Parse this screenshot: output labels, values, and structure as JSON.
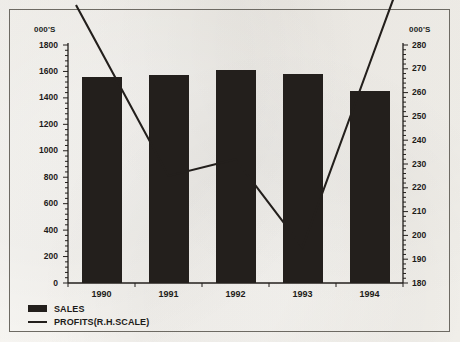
{
  "chart_data": {
    "type": "bar",
    "title": "",
    "categories": [
      "1990",
      "1991",
      "1992",
      "1993",
      "1994"
    ],
    "xlabel": "",
    "left_axis": {
      "label": "000'S",
      "ylim": [
        0,
        1800
      ],
      "tick_step": 200,
      "ticks": [
        "0",
        "200",
        "400",
        "600",
        "800",
        "1000",
        "1200",
        "1400",
        "1600",
        "1800"
      ]
    },
    "right_axis": {
      "label": "000'S",
      "ylim": [
        180,
        280
      ],
      "tick_step": 10,
      "ticks": [
        "180",
        "190",
        "200",
        "210",
        "220",
        "230",
        "240",
        "250",
        "260",
        "270",
        "280"
      ]
    },
    "grid": false,
    "legend_position": "bottom-left",
    "series": [
      {
        "name": "SALES",
        "type": "bar",
        "axis": "left",
        "color": "#231f1c",
        "values": [
          1560,
          1570,
          1610,
          1580,
          1455
        ]
      },
      {
        "name": "PROFITS(R.H.SCALE)",
        "type": "line",
        "axis": "right",
        "color": "#231f1c",
        "values": [
          277,
          225,
          232,
          195,
          272
        ]
      }
    ]
  },
  "legend": {
    "items": [
      {
        "label": "SALES",
        "marker": "filled-square"
      },
      {
        "label": "PROFITS(R.H.SCALE)",
        "marker": "line"
      }
    ]
  }
}
